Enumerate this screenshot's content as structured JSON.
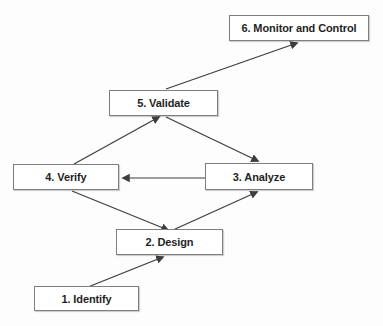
{
  "diagram": {
    "type": "flowchart",
    "nodes": [
      {
        "id": "identify",
        "label": "1. Identify"
      },
      {
        "id": "design",
        "label": "2. Design"
      },
      {
        "id": "analyze",
        "label": "3. Analyze"
      },
      {
        "id": "verify",
        "label": "4. Verify"
      },
      {
        "id": "validate",
        "label": "5. Validate"
      },
      {
        "id": "monitor",
        "label": "6. Monitor and Control"
      }
    ],
    "edges": [
      {
        "from": "1. Identify",
        "to": "2. Design"
      },
      {
        "from": "2. Design",
        "to": "3. Analyze"
      },
      {
        "from": "3. Analyze",
        "to": "4. Verify"
      },
      {
        "from": "4. Verify",
        "to": "2. Design"
      },
      {
        "from": "4. Verify",
        "to": "5. Validate"
      },
      {
        "from": "5. Validate",
        "to": "3. Analyze"
      },
      {
        "from": "5. Validate",
        "to": "6. Monitor and Control"
      }
    ],
    "colors": {
      "background": "#fdfdfd",
      "box_fill": "#ffffff",
      "box_border": "#7f7f7f",
      "text": "#1f1f1f",
      "arrow": "#3d3d3d"
    }
  }
}
